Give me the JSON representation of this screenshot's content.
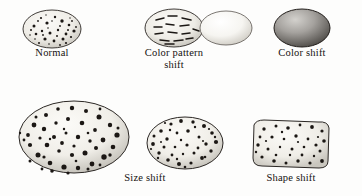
{
  "figure": {
    "type": "scientific-illustration",
    "background_color": "#fdfdfc",
    "ink_color": "#15110f"
  },
  "specimens": [
    {
      "id": "normal",
      "label": "Normal",
      "shape": "ellipse",
      "cx": 52,
      "cy": 29,
      "rx": 29,
      "ry": 19,
      "fill": "#f3f1ec",
      "speckles": "dense-dark-fine",
      "speckle_count": 34,
      "caption_x": 52,
      "caption_y": 53
    },
    {
      "id": "color-pattern-shift",
      "label": "Color pattern\nshift",
      "shape": "ellipse",
      "cx": 174,
      "cy": 28,
      "rx": 29,
      "ry": 19,
      "fill": "#f2f0ea",
      "speckles": "linear-streaks",
      "speckle_count": 14,
      "caption_x": 174,
      "caption_y": 52
    },
    {
      "id": "unmarked",
      "label": "",
      "shape": "ellipse",
      "cx": 226,
      "cy": 28,
      "rx": 26,
      "ry": 17,
      "fill": "#f7f6f2",
      "speckles": "none",
      "speckle_count": 0,
      "caption_x": 226,
      "caption_y": 52
    },
    {
      "id": "color-shift",
      "label": "Color shift",
      "shape": "ellipse",
      "cx": 302,
      "cy": 28,
      "rx": 28,
      "ry": 19,
      "fill": "#8d8b88",
      "speckles": "uniform-dark-shading",
      "speckle_count": 0,
      "caption_x": 302,
      "caption_y": 53
    },
    {
      "id": "size-shift-large",
      "label": "Size shift",
      "shape": "ellipse",
      "cx": 74,
      "cy": 137,
      "rx": 55,
      "ry": 36,
      "fill": "#f4f2ed",
      "speckles": "large-dark-blotches",
      "speckle_count": 52,
      "caption_x": 145,
      "caption_y": 178
    },
    {
      "id": "size-shift-medium",
      "label": "",
      "shape": "ellipse",
      "cx": 185,
      "cy": 143,
      "rx": 38,
      "ry": 26,
      "fill": "#f4f2ed",
      "speckles": "medium-dark-dots",
      "speckle_count": 40,
      "caption_x": 185,
      "caption_y": 178
    },
    {
      "id": "shape-shift",
      "label": "Shape shift",
      "shape": "rounded-rectangle",
      "cx": 291,
      "cy": 146,
      "rx": 38,
      "ry": 24,
      "fill": "#f3f1ec",
      "speckles": "scattered-dark-dots",
      "speckle_count": 34,
      "caption_x": 291,
      "caption_y": 178
    }
  ],
  "captions": {
    "normal": "Normal",
    "color_pattern_shift": "Color pattern\nshift",
    "color_shift": "Color shift",
    "size_shift": "Size shift",
    "shape_shift": "Shape shift"
  }
}
